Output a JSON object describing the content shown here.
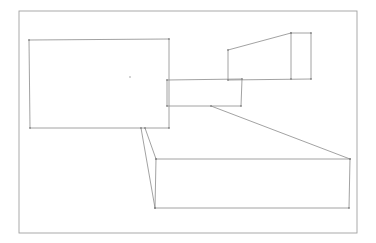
{
  "diagram": {
    "type": "hand-drawn sketch",
    "stroke_color": "#8a8a8a",
    "frame_color": "#a0a0a0",
    "background": "#ffffff",
    "frame": {
      "x": 19,
      "y": 11,
      "w": 338,
      "h": 222
    },
    "shapes": [
      {
        "id": "main-box",
        "kind": "rect",
        "points": [
          [
            29,
            40
          ],
          [
            169,
            39
          ],
          [
            169,
            128
          ],
          [
            30,
            128
          ]
        ]
      },
      {
        "id": "middle-box",
        "kind": "rect",
        "points": [
          [
            167,
            80
          ],
          [
            242,
            79
          ],
          [
            241,
            106
          ],
          [
            167,
            106
          ]
        ]
      },
      {
        "id": "upper-right-block",
        "kind": "polygon",
        "points": [
          [
            228,
            50
          ],
          [
            291,
            33
          ],
          [
            311,
            33
          ],
          [
            311,
            79
          ],
          [
            228,
            80
          ]
        ]
      },
      {
        "id": "upper-right-divider",
        "kind": "line",
        "points": [
          [
            291,
            33
          ],
          [
            291,
            79
          ]
        ]
      },
      {
        "id": "bottom-box",
        "kind": "rect",
        "points": [
          [
            156,
            159
          ],
          [
            350,
            159
          ],
          [
            349,
            208
          ],
          [
            155,
            208
          ]
        ]
      },
      {
        "id": "diagonal-connector",
        "kind": "line",
        "points": [
          [
            211,
            106
          ],
          [
            350,
            159
          ]
        ]
      },
      {
        "id": "left-connector-a",
        "kind": "line",
        "points": [
          [
            141,
            128
          ],
          [
            155,
            208
          ]
        ]
      },
      {
        "id": "left-connector-b",
        "kind": "line",
        "points": [
          [
            145,
            128
          ],
          [
            156,
            159
          ]
        ]
      }
    ],
    "center_mark": [
      130,
      77
    ]
  }
}
